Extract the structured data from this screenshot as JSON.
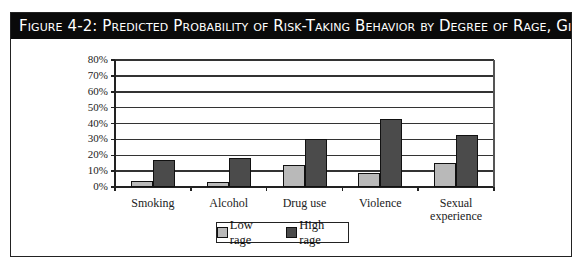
{
  "figure": {
    "title": "Figure 4-2:  Predicted Probability of Risk-Taking Behavior by Degree of Rage, Girls"
  },
  "colors": {
    "low_rage": "#b9b9b9",
    "high_rage": "#4b4b4b",
    "title_bg": "#0a0a0a"
  },
  "chart_data": {
    "type": "bar",
    "title": "Figure 4-2: Predicted Probability of Risk-Taking Behavior by Degree of Rage, Girls",
    "categories": [
      "Smoking",
      "Alcohol",
      "Drug use",
      "Violence",
      "Sexual experience"
    ],
    "series": [
      {
        "name": "Low rage",
        "values": [
          4,
          3,
          14,
          9,
          15
        ]
      },
      {
        "name": "High rage",
        "values": [
          17,
          18,
          30,
          43,
          33
        ]
      }
    ],
    "xlabel": "",
    "ylabel": "",
    "ylim": [
      0,
      80
    ],
    "yticks": [
      "0%",
      "10%",
      "20%",
      "30%",
      "40%",
      "50%",
      "60%",
      "70%",
      "80%"
    ],
    "grid": true,
    "legend_position": "bottom"
  },
  "legend": {
    "items": [
      {
        "label": "Low rage"
      },
      {
        "label": "High rage"
      }
    ]
  },
  "x_labels": [
    "Smoking",
    "Alcohol",
    "Drug use",
    "Violence",
    "Sexual\nexperience"
  ]
}
